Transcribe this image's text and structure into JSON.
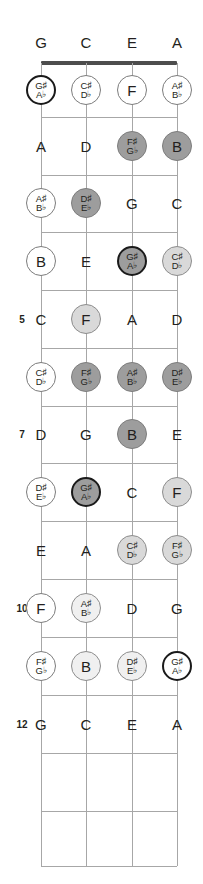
{
  "diagram": {
    "instrument_strings": 4,
    "frets_shown": 12,
    "geometry": {
      "string_x": [
        41,
        86,
        132,
        177
      ],
      "nut_y": 63,
      "fret_y": [
        63,
        117,
        175,
        232,
        290,
        348,
        406,
        463,
        521,
        579,
        637,
        695,
        753,
        811,
        866
      ],
      "slot_y": [
        90,
        146,
        203,
        261,
        319,
        377,
        434,
        492,
        550,
        608,
        666,
        724,
        782
      ],
      "circle_diameter": 30
    },
    "colors": {
      "nut": "#4d4d4d",
      "fret_line": "#a7a7a7",
      "string_line": "#a7a7a7",
      "text": "#231f20",
      "ring_heavy": "#1a1a1a",
      "ring_light": "#8d8d8d",
      "fill_white": "#ffffff",
      "fill_light": "#f0f0f0",
      "fill_mid": "#d9d9d9",
      "fill_dark": "#9d9d9d"
    },
    "string_labels": [
      {
        "label": "G",
        "x": 41
      },
      {
        "label": "C",
        "x": 86
      },
      {
        "label": "E",
        "x": 132
      },
      {
        "label": "A",
        "x": 177
      }
    ],
    "fret_numbers": [
      {
        "label": "5",
        "y": 319
      },
      {
        "label": "7",
        "y": 434
      },
      {
        "label": "10",
        "y": 608
      },
      {
        "label": "12",
        "y": 724
      }
    ],
    "notes": [
      {
        "fret": 1,
        "string": 1,
        "x": 41,
        "y": 90,
        "kind": "circle",
        "style": "root",
        "natural": "",
        "top": "G♯",
        "bottom": "A♭"
      },
      {
        "fret": 1,
        "string": 2,
        "x": 86,
        "y": 90,
        "kind": "circle",
        "style": "open",
        "natural": "",
        "top": "C♯",
        "bottom": "D♭"
      },
      {
        "fret": 1,
        "string": 3,
        "x": 132,
        "y": 90,
        "kind": "circle",
        "style": "open",
        "natural": "F",
        "top": "",
        "bottom": ""
      },
      {
        "fret": 1,
        "string": 4,
        "x": 177,
        "y": 90,
        "kind": "circle",
        "style": "open",
        "natural": "",
        "top": "A♯",
        "bottom": "B♭"
      },
      {
        "fret": 2,
        "string": 1,
        "x": 41,
        "y": 146,
        "kind": "plain",
        "style": "plain",
        "natural": "A",
        "top": "",
        "bottom": ""
      },
      {
        "fret": 2,
        "string": 2,
        "x": 86,
        "y": 146,
        "kind": "plain",
        "style": "plain",
        "natural": "D",
        "top": "",
        "bottom": ""
      },
      {
        "fret": 2,
        "string": 3,
        "x": 132,
        "y": 146,
        "kind": "circle",
        "style": "dark",
        "natural": "",
        "top": "F♯",
        "bottom": "G♭"
      },
      {
        "fret": 2,
        "string": 4,
        "x": 177,
        "y": 146,
        "kind": "circle",
        "style": "dark",
        "natural": "B",
        "top": "",
        "bottom": ""
      },
      {
        "fret": 3,
        "string": 1,
        "x": 41,
        "y": 203,
        "kind": "circle",
        "style": "open",
        "natural": "",
        "top": "A♯",
        "bottom": "B♭"
      },
      {
        "fret": 3,
        "string": 2,
        "x": 86,
        "y": 203,
        "kind": "circle",
        "style": "dark",
        "natural": "",
        "top": "D♯",
        "bottom": "E♭"
      },
      {
        "fret": 3,
        "string": 3,
        "x": 132,
        "y": 203,
        "kind": "plain",
        "style": "plain",
        "natural": "G",
        "top": "",
        "bottom": ""
      },
      {
        "fret": 3,
        "string": 4,
        "x": 177,
        "y": 203,
        "kind": "plain",
        "style": "plain",
        "natural": "C",
        "top": "",
        "bottom": ""
      },
      {
        "fret": 4,
        "string": 1,
        "x": 41,
        "y": 261,
        "kind": "circle",
        "style": "open",
        "natural": "B",
        "top": "",
        "bottom": ""
      },
      {
        "fret": 4,
        "string": 2,
        "x": 86,
        "y": 261,
        "kind": "plain",
        "style": "plain",
        "natural": "E",
        "top": "",
        "bottom": ""
      },
      {
        "fret": 4,
        "string": 3,
        "x": 132,
        "y": 261,
        "kind": "circle",
        "style": "rootdark",
        "natural": "",
        "top": "G♯",
        "bottom": "A♭"
      },
      {
        "fret": 4,
        "string": 4,
        "x": 177,
        "y": 261,
        "kind": "circle",
        "style": "mid",
        "natural": "",
        "top": "C♯",
        "bottom": "D♭"
      },
      {
        "fret": 5,
        "string": 1,
        "x": 41,
        "y": 319,
        "kind": "plain",
        "style": "plain",
        "natural": "C",
        "top": "",
        "bottom": ""
      },
      {
        "fret": 5,
        "string": 2,
        "x": 86,
        "y": 319,
        "kind": "circle",
        "style": "mid",
        "natural": "F",
        "top": "",
        "bottom": ""
      },
      {
        "fret": 5,
        "string": 3,
        "x": 132,
        "y": 319,
        "kind": "plain",
        "style": "plain",
        "natural": "A",
        "top": "",
        "bottom": ""
      },
      {
        "fret": 5,
        "string": 4,
        "x": 177,
        "y": 319,
        "kind": "plain",
        "style": "plain",
        "natural": "D",
        "top": "",
        "bottom": ""
      },
      {
        "fret": 6,
        "string": 1,
        "x": 41,
        "y": 377,
        "kind": "circle",
        "style": "open",
        "natural": "",
        "top": "C♯",
        "bottom": "D♭"
      },
      {
        "fret": 6,
        "string": 2,
        "x": 86,
        "y": 377,
        "kind": "circle",
        "style": "dark",
        "natural": "",
        "top": "F♯",
        "bottom": "G♭"
      },
      {
        "fret": 6,
        "string": 3,
        "x": 132,
        "y": 377,
        "kind": "circle",
        "style": "dark",
        "natural": "",
        "top": "A♯",
        "bottom": "B♭"
      },
      {
        "fret": 6,
        "string": 4,
        "x": 177,
        "y": 377,
        "kind": "circle",
        "style": "dark",
        "natural": "",
        "top": "D♯",
        "bottom": "E♭"
      },
      {
        "fret": 7,
        "string": 1,
        "x": 41,
        "y": 434,
        "kind": "plain",
        "style": "plain",
        "natural": "D",
        "top": "",
        "bottom": ""
      },
      {
        "fret": 7,
        "string": 2,
        "x": 86,
        "y": 434,
        "kind": "plain",
        "style": "plain",
        "natural": "G",
        "top": "",
        "bottom": ""
      },
      {
        "fret": 7,
        "string": 3,
        "x": 132,
        "y": 434,
        "kind": "circle",
        "style": "dark",
        "natural": "B",
        "top": "",
        "bottom": ""
      },
      {
        "fret": 7,
        "string": 4,
        "x": 177,
        "y": 434,
        "kind": "plain",
        "style": "plain",
        "natural": "E",
        "top": "",
        "bottom": ""
      },
      {
        "fret": 8,
        "string": 1,
        "x": 41,
        "y": 492,
        "kind": "circle",
        "style": "open",
        "natural": "",
        "top": "D♯",
        "bottom": "E♭"
      },
      {
        "fret": 8,
        "string": 2,
        "x": 86,
        "y": 492,
        "kind": "circle",
        "style": "rootdark",
        "natural": "",
        "top": "G♯",
        "bottom": "A♭"
      },
      {
        "fret": 8,
        "string": 3,
        "x": 132,
        "y": 492,
        "kind": "plain",
        "style": "plain",
        "natural": "C",
        "top": "",
        "bottom": ""
      },
      {
        "fret": 8,
        "string": 4,
        "x": 177,
        "y": 492,
        "kind": "circle",
        "style": "mid",
        "natural": "F",
        "top": "",
        "bottom": ""
      },
      {
        "fret": 9,
        "string": 1,
        "x": 41,
        "y": 550,
        "kind": "plain",
        "style": "plain",
        "natural": "E",
        "top": "",
        "bottom": ""
      },
      {
        "fret": 9,
        "string": 2,
        "x": 86,
        "y": 550,
        "kind": "plain",
        "style": "plain",
        "natural": "A",
        "top": "",
        "bottom": ""
      },
      {
        "fret": 9,
        "string": 3,
        "x": 132,
        "y": 550,
        "kind": "circle",
        "style": "mid",
        "natural": "",
        "top": "C♯",
        "bottom": "D♭"
      },
      {
        "fret": 9,
        "string": 4,
        "x": 177,
        "y": 550,
        "kind": "circle",
        "style": "mid",
        "natural": "",
        "top": "F♯",
        "bottom": "G♭"
      },
      {
        "fret": 10,
        "string": 1,
        "x": 41,
        "y": 608,
        "kind": "circle",
        "style": "open",
        "natural": "F",
        "top": "",
        "bottom": ""
      },
      {
        "fret": 10,
        "string": 2,
        "x": 86,
        "y": 608,
        "kind": "circle",
        "style": "light",
        "natural": "",
        "top": "A♯",
        "bottom": "B♭"
      },
      {
        "fret": 10,
        "string": 3,
        "x": 132,
        "y": 608,
        "kind": "plain",
        "style": "plain",
        "natural": "D",
        "top": "",
        "bottom": ""
      },
      {
        "fret": 10,
        "string": 4,
        "x": 177,
        "y": 608,
        "kind": "plain",
        "style": "plain",
        "natural": "G",
        "top": "",
        "bottom": ""
      },
      {
        "fret": 11,
        "string": 1,
        "x": 41,
        "y": 666,
        "kind": "circle",
        "style": "open",
        "natural": "",
        "top": "F♯",
        "bottom": "G♭"
      },
      {
        "fret": 11,
        "string": 2,
        "x": 86,
        "y": 666,
        "kind": "circle",
        "style": "light",
        "natural": "B",
        "top": "",
        "bottom": ""
      },
      {
        "fret": 11,
        "string": 3,
        "x": 132,
        "y": 666,
        "kind": "circle",
        "style": "light",
        "natural": "",
        "top": "D♯",
        "bottom": "E♭"
      },
      {
        "fret": 11,
        "string": 4,
        "x": 177,
        "y": 666,
        "kind": "circle",
        "style": "root",
        "natural": "",
        "top": "G♯",
        "bottom": "A♭"
      },
      {
        "fret": 12,
        "string": 1,
        "x": 41,
        "y": 724,
        "kind": "plain",
        "style": "plain",
        "natural": "G",
        "top": "",
        "bottom": ""
      },
      {
        "fret": 12,
        "string": 2,
        "x": 86,
        "y": 724,
        "kind": "plain",
        "style": "plain",
        "natural": "C",
        "top": "",
        "bottom": ""
      },
      {
        "fret": 12,
        "string": 3,
        "x": 132,
        "y": 724,
        "kind": "plain",
        "style": "plain",
        "natural": "E",
        "top": "",
        "bottom": ""
      },
      {
        "fret": 12,
        "string": 4,
        "x": 177,
        "y": 724,
        "kind": "plain",
        "style": "plain",
        "natural": "A",
        "top": "",
        "bottom": ""
      }
    ]
  }
}
